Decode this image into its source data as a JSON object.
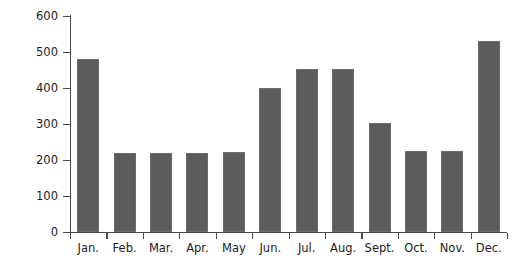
{
  "chart_data": {
    "type": "bar",
    "title": "",
    "subtitle": "",
    "xlabel": "",
    "ylabel": "Euro",
    "categories": [
      "Jan.",
      "Feb.",
      "Mar.",
      "Apr.",
      "May",
      "Jun.",
      "Jul.",
      "Aug.",
      "Sept.",
      "Oct.",
      "Nov.",
      "Dec."
    ],
    "values": [
      480,
      220,
      220,
      220,
      222,
      400,
      452,
      452,
      302,
      225,
      225,
      530
    ],
    "ylim": [
      0,
      600
    ],
    "yticks": [
      0,
      100,
      200,
      300,
      400,
      500,
      600
    ],
    "ytick_labels": [
      "0",
      "100",
      "200",
      "300",
      "400",
      "500",
      "600"
    ],
    "grid": false,
    "legend": null,
    "bar_color": "#5c5c5c",
    "axis_color": "#4a4a4a",
    "background": "#ffffff"
  }
}
